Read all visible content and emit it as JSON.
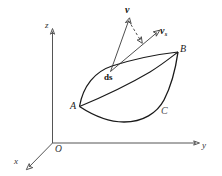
{
  "figure": {
    "background_color": "#ffffff",
    "stroke_color": "#1a1a1a",
    "axis_color": "#555555",
    "axes": {
      "x_label": "x",
      "y_label": "y",
      "z_label": "z",
      "origin_label": "O"
    },
    "points": {
      "a_label": "A",
      "b_label": "B",
      "c_label": "C"
    },
    "elements": {
      "arc_length_label": "ds",
      "velocity_label": "v",
      "surface_velocity_label": "v",
      "surface_velocity_subscript": "s"
    }
  }
}
